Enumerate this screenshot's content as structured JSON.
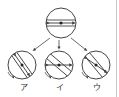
{
  "diagram": {
    "top_disk": {
      "band_angle_deg": 0,
      "arrow_angle_deg": 0
    },
    "options": [
      {
        "label": "ア",
        "band_angle_deg": 55,
        "arrow_angle_deg": 55,
        "rotation": "counterclockwise"
      },
      {
        "label": "イ",
        "band_angle_deg": 40,
        "arrow_angle_deg": 0,
        "rotation": "counterclockwise"
      },
      {
        "label": "ウ",
        "band_angle_deg": 50,
        "arrow_angle_deg": -35,
        "rotation": "counterclockwise"
      }
    ],
    "colors": {
      "stroke": "#444444",
      "background": "#ffffff"
    }
  }
}
